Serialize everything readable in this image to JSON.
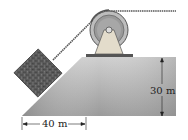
{
  "figure": {
    "type": "physics-diagram",
    "dimensions": {
      "horizontal_label": "40 m",
      "vertical_label": "30 m"
    },
    "colors": {
      "ground_light": "#d9d9d9",
      "ground_dark": "#8e8e8e",
      "block": "#5e5e5e",
      "pulley_outer": "#b8b8b8",
      "pulley_inner": "#8a8a8a",
      "support": "#e2dccc",
      "rope": "#555555"
    }
  }
}
